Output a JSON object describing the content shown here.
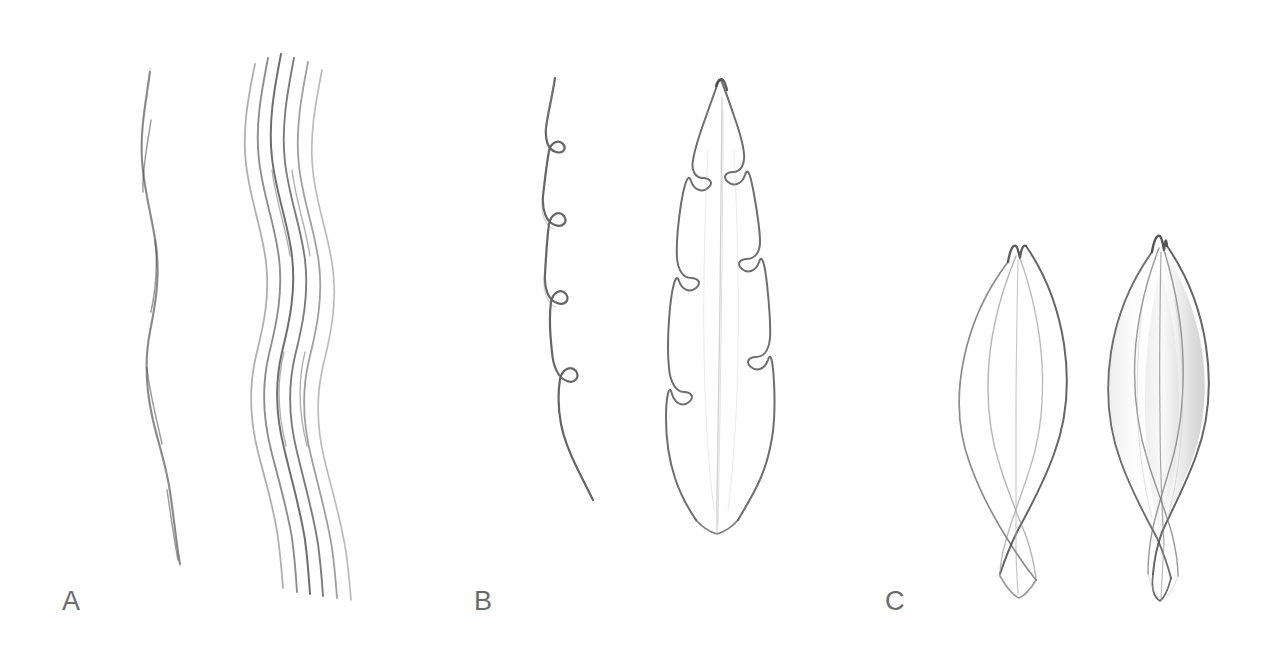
{
  "figure": {
    "type": "botanical-pencil-study-plate",
    "background_color": "#ffffff",
    "label_color": "#6b6b6b",
    "graphite_colors": {
      "dark": "#4a4a4a",
      "mid": "#6e6e6e",
      "soft": "#8d8d8d",
      "faint": "#b4b4b4",
      "hair": "#c9c9c9"
    }
  },
  "panels": [
    {
      "id": "a",
      "label": "A",
      "subject": "wavy-line-studies",
      "elements": [
        {
          "name": "single-wavy-line",
          "count": 1,
          "description": "single undulating vertical graphite line"
        },
        {
          "name": "wavy-line-bundle",
          "count": 6,
          "description": "bundle of six parallel undulating vertical lines fanning at base"
        }
      ]
    },
    {
      "id": "b",
      "label": "B",
      "subject": "serrate-leaf-margin-study",
      "elements": [
        {
          "name": "serrated-margin-detail",
          "teeth": 7,
          "description": "isolated margin line with hooked sawtooth teeth"
        },
        {
          "name": "lanceolate-leaf",
          "teeth_per_side": 6,
          "description": "outline of lanceolate leaf with serrate margins, acute apex and faint midrib"
        }
      ]
    },
    {
      "id": "c",
      "label": "C",
      "subject": "bud-scale-studies",
      "elements": [
        {
          "name": "bud-outline",
          "shading": "none",
          "description": "outline-only elliptic bud scale with bifid apex and tapering stalk"
        },
        {
          "name": "bud-shaded",
          "shading": "graphite",
          "description": "same bud scale rendered with soft graphite tonal shading"
        }
      ]
    }
  ]
}
